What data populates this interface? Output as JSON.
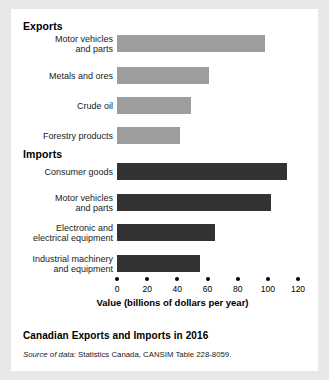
{
  "figure": {
    "sections": [
      {
        "name": "exports",
        "heading": "Exports"
      },
      {
        "name": "imports",
        "heading": "Imports"
      }
    ],
    "caption": "Canadian Exports and Imports in 2016",
    "source_prefix": "Source of data:",
    "source_text": " Statistics Canada, CANSIM Table 228-8059.",
    "colors": {
      "export_bar": "#9d9d9d",
      "import_bar": "#333333",
      "page_background": "#e8e8e6",
      "figure_background": "#ffffff"
    }
  },
  "chart_data": {
    "type": "bar",
    "orientation": "horizontal",
    "title": "Canadian Exports and Imports in 2016",
    "xlabel": "Value (billions of dollars per year)",
    "ylabel": "",
    "xlim": [
      0,
      120
    ],
    "xticks": [
      0,
      20,
      40,
      60,
      80,
      100,
      120
    ],
    "xticklabels": [
      "0",
      "20",
      "40",
      "60",
      "80",
      "100",
      "120"
    ],
    "grid": false,
    "legend": false,
    "groups": [
      {
        "name": "Exports",
        "color": "#9d9d9d",
        "categories": [
          "Motor vehicles\nand parts",
          "Metals and ores",
          "Crude oil",
          "Forestry products"
        ],
        "values": [
          98,
          61,
          49,
          42
        ]
      },
      {
        "name": "Imports",
        "color": "#333333",
        "categories": [
          "Consumer goods",
          "Motor vehicles\nand parts",
          "Electronic and\nelectrical equipment",
          "Industrial machinery\nand equipment"
        ],
        "values": [
          113,
          102,
          65,
          55
        ]
      }
    ]
  }
}
